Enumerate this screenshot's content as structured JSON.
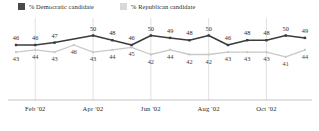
{
  "legend": {
    "items": [
      {
        "label": "% Democratic candidate",
        "color": "#4a4a4a",
        "key": "dem"
      },
      {
        "label": "% Republican candidate",
        "color": "#d8d8d8",
        "key": "rep"
      }
    ]
  },
  "axis": {
    "ticks": [
      "Feb '02",
      "Apr '02",
      "Jun '02",
      "Aug '02",
      "Oct '02"
    ]
  },
  "chart_data": {
    "type": "line",
    "title": "",
    "subtitle": "",
    "xlabel": "",
    "ylabel": "",
    "grid": true,
    "legend_position": "top-left",
    "ylim": [
      38,
      54
    ],
    "x_tick_labels": [
      "Feb '02",
      "Apr '02",
      "Jun '02",
      "Aug '02",
      "Oct '02"
    ],
    "x_tick_indices": [
      1,
      4,
      7,
      10,
      13
    ],
    "n_points": 16,
    "series": [
      {
        "name": "% Democratic candidate",
        "key": "dem",
        "color": "#3c3c3c",
        "values": [
          46,
          46,
          47,
          null,
          50,
          48,
          46,
          50,
          49,
          48,
          50,
          46,
          48,
          48,
          50,
          49
        ],
        "labels": [
          "46",
          "46",
          "47",
          "",
          "50",
          "48",
          "46",
          "50",
          "49",
          "48",
          "50",
          "46",
          "48",
          "48",
          "50",
          "49"
        ]
      },
      {
        "name": "% Republican candidate",
        "key": "rep",
        "color": "#c9c9c9",
        "values": [
          43,
          44,
          43,
          46,
          43,
          44,
          45,
          42,
          44,
          42,
          42,
          43,
          43,
          43,
          41,
          44
        ],
        "labels": [
          "43",
          "44",
          "43",
          "46",
          "43",
          "44",
          "45",
          "42",
          "44",
          "42",
          "42",
          "43",
          "43",
          "43",
          "41",
          "44"
        ]
      }
    ]
  }
}
